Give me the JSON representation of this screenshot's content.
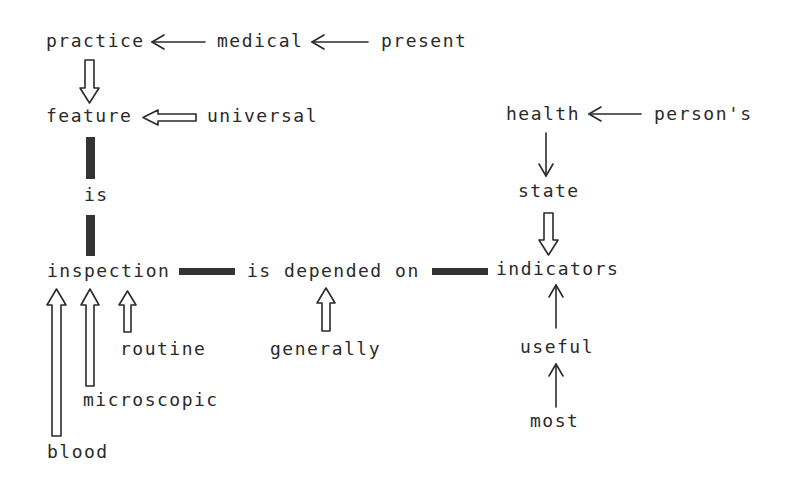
{
  "diagram": {
    "type": "conceptual-dependency-graph",
    "nodes": {
      "practice": "practice",
      "medical": "medical",
      "present": "present",
      "feature": "feature",
      "universal": "universal",
      "is": "is",
      "inspection": "inspection",
      "is_depended_on": "is depended on",
      "indicators": "indicators",
      "health": "health",
      "persons": "person's",
      "state": "state",
      "routine": "routine",
      "microscopic": "microscopic",
      "blood": "blood",
      "generally": "generally",
      "useful": "useful",
      "most": "most"
    },
    "edges": [
      {
        "from": "medical",
        "to": "practice",
        "style": "single-arrow"
      },
      {
        "from": "present",
        "to": "medical",
        "style": "single-arrow"
      },
      {
        "from": "practice",
        "to": "feature",
        "style": "double-arrow"
      },
      {
        "from": "universal",
        "to": "feature",
        "style": "double-arrow"
      },
      {
        "from": "feature",
        "to": "is",
        "style": "thick-link"
      },
      {
        "from": "is",
        "to": "inspection",
        "style": "thick-link"
      },
      {
        "from": "inspection",
        "to": "is_depended_on",
        "style": "thick-link"
      },
      {
        "from": "is_depended_on",
        "to": "indicators",
        "style": "thick-link"
      },
      {
        "from": "persons",
        "to": "health",
        "style": "single-arrow"
      },
      {
        "from": "health",
        "to": "state",
        "style": "single-arrow"
      },
      {
        "from": "state",
        "to": "indicators",
        "style": "double-arrow"
      },
      {
        "from": "blood",
        "to": "inspection",
        "style": "double-arrow"
      },
      {
        "from": "microscopic",
        "to": "inspection",
        "style": "double-arrow"
      },
      {
        "from": "routine",
        "to": "inspection",
        "style": "double-arrow"
      },
      {
        "from": "generally",
        "to": "is_depended_on",
        "style": "double-arrow"
      },
      {
        "from": "useful",
        "to": "indicators",
        "style": "single-arrow"
      },
      {
        "from": "most",
        "to": "useful",
        "style": "single-arrow"
      }
    ],
    "colors": {
      "text": "#2a2a2a",
      "line": "#2a2a2a",
      "thick_link": "#333333",
      "background": "#ffffff"
    }
  }
}
